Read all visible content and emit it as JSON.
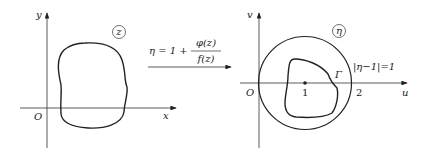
{
  "left_panel": {
    "plane_label": "z",
    "x_axis_label": "x",
    "y_axis_label": "y",
    "origin_label": "O"
  },
  "mapping": {
    "lhs": "η = 1 +",
    "numerator": "φ(z)",
    "denominator": "f(z)"
  },
  "right_panel": {
    "plane_label": "η",
    "u_axis_label": "u",
    "v_axis_label": "v",
    "origin_label": "O",
    "tick_1": "1",
    "tick_2": "2",
    "curve_label": "Γ",
    "circle_label": "|η−1|=1"
  }
}
